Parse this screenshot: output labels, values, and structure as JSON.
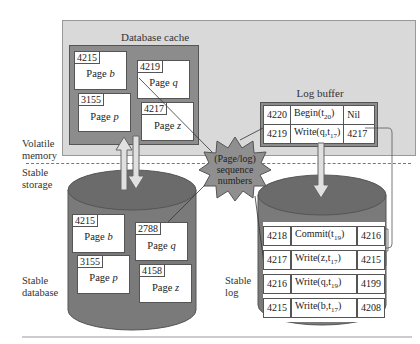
{
  "volatile": {
    "label_line1": "Volatile",
    "label_line2": "memory",
    "database_cache": {
      "title": "Database cache",
      "pages": [
        {
          "lsn": "4215",
          "name": "Page",
          "var": "b"
        },
        {
          "lsn": "4219",
          "name": "Page",
          "var": "q"
        },
        {
          "lsn": "3155",
          "name": "Page",
          "var": "p"
        },
        {
          "lsn": "4217",
          "name": "Page",
          "var": "z"
        }
      ]
    },
    "log_buffer": {
      "title": "Log buffer",
      "records": [
        {
          "lsn": "4220",
          "op": "Begin(t",
          "sub": "20",
          "close": ")",
          "prev": "Nil"
        },
        {
          "lsn": "4219",
          "op": "Write(q,t",
          "sub": "17",
          "close": ")",
          "prev": "4217"
        }
      ]
    }
  },
  "stable": {
    "label_line1": "Stable",
    "label_line2": "storage",
    "database": {
      "label_line1": "Stable",
      "label_line2": "database",
      "pages": [
        {
          "lsn": "4215",
          "name": "Page",
          "var": "b"
        },
        {
          "lsn": "2788",
          "name": "Page",
          "var": "q"
        },
        {
          "lsn": "3155",
          "name": "Page",
          "var": "p"
        },
        {
          "lsn": "4158",
          "name": "Page",
          "var": "z"
        }
      ]
    },
    "log": {
      "label_line1": "Stable",
      "label_line2": "log",
      "records": [
        {
          "lsn": "4218",
          "op": "Commit(t",
          "sub": "19",
          "close": ")",
          "prev": "4216"
        },
        {
          "lsn": "4217",
          "op": "Write(z,t",
          "sub": "17",
          "close": ")",
          "prev": "4215"
        },
        {
          "lsn": "4216",
          "op": "Write(q,t",
          "sub": "19",
          "close": ")",
          "prev": "4199"
        },
        {
          "lsn": "4215",
          "op": "Write(b,t",
          "sub": "17",
          "close": ")",
          "prev": "4208"
        }
      ]
    }
  },
  "starburst": {
    "line1": "(Page/log)",
    "line2": "sequence",
    "line3": "numbers"
  },
  "colors": {
    "volatile_bg": "#d9d9d9",
    "cache_bg": "#8c8c8c",
    "disk_body": "#7a7a7a",
    "disk_top": "#6b6b6b",
    "starburst": "#8f8f8f",
    "arrow_fill": "#e0e0e0"
  }
}
